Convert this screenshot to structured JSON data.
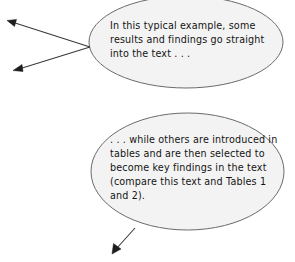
{
  "diagram": {
    "background_color": "#ffffff",
    "ellipse_fill": "#f3f3f3",
    "ellipse_stroke": "#6b6b6b",
    "arrow_color": "#1d1d1d",
    "bubbles": [
      {
        "id": "ellipse-top",
        "text": "In this typical example, some results and findings go straight into the text . . ."
      },
      {
        "id": "ellipse-bottom",
        "text": ". . . while others are introduced in tables and are then selected to become key findings in the text (compare this text and Tables 1 and 2)."
      }
    ],
    "arrows": [
      {
        "id": "arrow-top-upper",
        "from": "ellipse-top",
        "direction": "upper-left"
      },
      {
        "id": "arrow-top-lower",
        "from": "ellipse-top",
        "direction": "lower-left"
      },
      {
        "id": "arrow-bottom",
        "from": "ellipse-bottom",
        "direction": "lower-left"
      }
    ]
  }
}
